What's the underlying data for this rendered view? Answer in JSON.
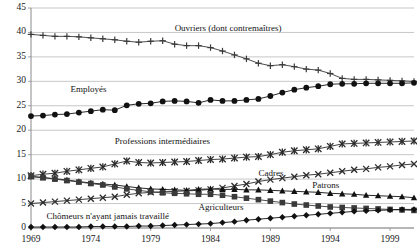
{
  "chart_data": {
    "type": "line",
    "title": "",
    "subtitle": "",
    "xlabel": "",
    "ylabel": "",
    "xlim": [
      1969,
      2001
    ],
    "ylim": [
      0,
      45
    ],
    "ytick_step": 5,
    "xtick_step": 5,
    "grid": true,
    "grid_axis": "y",
    "legend_position": "inline-annotations",
    "yticks": [
      "0",
      "5",
      "10",
      "15",
      "20",
      "25",
      "30",
      "35",
      "40",
      "45"
    ],
    "xticks": [
      "1969",
      "1974",
      "1979",
      "1984",
      "1989",
      "1994",
      "1999"
    ],
    "x": [
      1969,
      1970,
      1971,
      1972,
      1973,
      1974,
      1975,
      1976,
      1977,
      1978,
      1979,
      1980,
      1981,
      1982,
      1983,
      1984,
      1985,
      1986,
      1987,
      1988,
      1989,
      1990,
      1991,
      1992,
      1993,
      1994,
      1995,
      1996,
      1997,
      1998,
      1999,
      2000,
      2001
    ],
    "series": [
      {
        "name": "Ouvriers (dont contremaîtres)",
        "marker": "plus",
        "color": "#3a3a3a",
        "label_x": 1981.0,
        "label_y": 40.7,
        "values": [
          39.6,
          39.4,
          39.2,
          39.2,
          39.1,
          38.9,
          38.7,
          38.5,
          38.2,
          38.0,
          38.2,
          38.3,
          37.6,
          37.3,
          37.3,
          36.9,
          36.2,
          35.4,
          34.6,
          33.7,
          33.2,
          33.4,
          33.0,
          32.5,
          32.3,
          31.6,
          30.6,
          30.4,
          30.4,
          30.3,
          30.2,
          30.1,
          30.0
        ]
      },
      {
        "name": "Employés",
        "marker": "circle",
        "color": "#111111",
        "label_x": 1972.3,
        "label_y": 28.3,
        "values": [
          22.9,
          23.0,
          23.2,
          23.3,
          23.6,
          23.9,
          24.2,
          24.1,
          25.1,
          25.4,
          25.5,
          25.9,
          26.0,
          25.9,
          25.6,
          26.2,
          26.0,
          26.0,
          26.2,
          26.4,
          27.0,
          27.7,
          28.3,
          28.7,
          29.0,
          29.4,
          29.5,
          29.5,
          29.6,
          29.6,
          29.6,
          29.6,
          29.7
        ]
      },
      {
        "name": "Professions intermédiaires",
        "marker": "star6",
        "color": "#2b2b2b",
        "label_x": 1976.0,
        "label_y": 17.6,
        "values": [
          10.7,
          11.0,
          11.2,
          11.6,
          11.9,
          12.2,
          12.5,
          13.1,
          13.7,
          13.4,
          13.3,
          13.4,
          13.5,
          13.6,
          13.8,
          14.0,
          14.1,
          14.3,
          14.5,
          14.6,
          15.0,
          15.5,
          15.8,
          16.0,
          16.2,
          16.7,
          17.2,
          17.3,
          17.4,
          17.5,
          17.6,
          17.7,
          17.8
        ]
      },
      {
        "name": "Cadres",
        "marker": "cross",
        "color": "#2b2b2b",
        "label_x": 1988.0,
        "label_y": 11.1,
        "values": [
          5.0,
          5.2,
          5.4,
          5.6,
          5.8,
          6.0,
          6.2,
          6.4,
          6.8,
          7.1,
          7.3,
          7.4,
          7.5,
          7.6,
          7.7,
          7.9,
          8.2,
          8.6,
          9.0,
          9.5,
          9.9,
          10.2,
          10.5,
          10.8,
          11.0,
          11.3,
          11.6,
          11.9,
          12.1,
          12.4,
          12.6,
          12.9,
          13.1
        ]
      },
      {
        "name": "Patrons",
        "marker": "triangle",
        "color": "#111111",
        "label_x": 1992.5,
        "label_y": 8.5,
        "values": [
          10.5,
          10.3,
          10.1,
          9.8,
          9.5,
          9.2,
          9.0,
          8.8,
          8.5,
          8.2,
          8.0,
          7.9,
          7.8,
          7.7,
          7.9,
          8.0,
          7.9,
          7.9,
          7.8,
          7.8,
          7.7,
          7.6,
          7.5,
          7.4,
          7.3,
          7.1,
          7.0,
          6.9,
          6.7,
          6.6,
          6.5,
          6.4,
          6.2
        ]
      },
      {
        "name": "Agriculteurs",
        "marker": "square",
        "color": "#3a3a3a",
        "label_x": 1983.0,
        "label_y": 4.1,
        "values": [
          10.6,
          10.3,
          10.0,
          9.7,
          9.4,
          9.1,
          8.8,
          8.4,
          8.0,
          7.7,
          7.4,
          7.2,
          7.1,
          7.0,
          6.9,
          6.9,
          6.7,
          6.4,
          6.1,
          5.8,
          5.5,
          5.2,
          4.9,
          4.7,
          4.5,
          4.3,
          4.2,
          4.1,
          4.0,
          3.9,
          3.8,
          3.7,
          3.6
        ]
      },
      {
        "name": "Chômeurs n'ayant jamais travaillé",
        "marker": "diamond",
        "color": "#111111",
        "label_x": 1970.3,
        "label_y": 2.2,
        "values": [
          0.2,
          0.2,
          0.2,
          0.2,
          0.2,
          0.3,
          0.3,
          0.3,
          0.3,
          0.4,
          0.4,
          0.5,
          0.6,
          0.7,
          0.8,
          0.9,
          1.1,
          1.3,
          1.6,
          1.8,
          2.0,
          2.2,
          2.4,
          2.6,
          2.8,
          3.0,
          3.2,
          3.4,
          3.5,
          3.6,
          3.7,
          3.8,
          3.8
        ]
      }
    ]
  },
  "style": {
    "background": "#ffffff",
    "grid_color": "#b9b9b9",
    "axis_color": "#8a8a8a",
    "text_color": "#1a1a1a"
  }
}
